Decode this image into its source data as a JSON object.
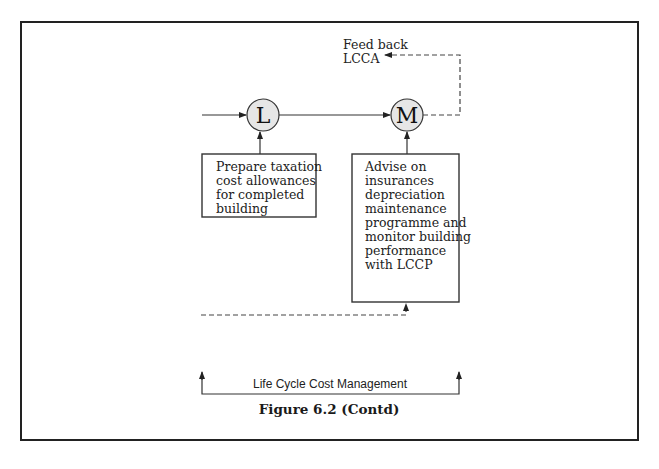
{
  "figure": {
    "caption": "Figure 6.2 (Contd)"
  },
  "nodes": [
    {
      "id": "L",
      "label": "L"
    },
    {
      "id": "M",
      "label": "M"
    }
  ],
  "boxes": {
    "L": {
      "lines": [
        "Prepare taxation",
        "cost allowances",
        "for completed",
        "building"
      ]
    },
    "M": {
      "lines": [
        "Advise on",
        "insurances",
        "depreciation",
        "maintenance",
        "programme and",
        "monitor building",
        "performance",
        "with LCCP"
      ]
    }
  },
  "feedback": {
    "lines": [
      "Feed back",
      "LCCA"
    ]
  },
  "bracket": {
    "label": "Life Cycle Cost Management"
  },
  "colors": {
    "line": "#333333",
    "node_fill": "#e6e6e6",
    "frame": "#222222"
  }
}
